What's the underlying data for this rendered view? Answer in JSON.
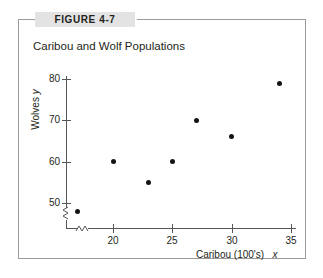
{
  "figure": {
    "label": "FIGURE 4-7",
    "frame_color": "#9a9a9a",
    "label_background": "#e3e3e3"
  },
  "chart_data": {
    "type": "scatter",
    "title": "Caribou and Wolf Populations",
    "xlabel": "Caribou (100's)  x",
    "xlabel_text": "Caribou (100's)",
    "xlabel_var": "x",
    "ylabel": "Wolves  y",
    "ylabel_text": "Wolves",
    "ylabel_var": "y",
    "xlim": [
      16,
      35.5
    ],
    "ylim": [
      46,
      82
    ],
    "xticks": [
      20,
      25,
      30,
      35
    ],
    "xtick_labels": [
      "20",
      "25",
      "30",
      "35"
    ],
    "yticks": [
      50,
      60,
      70,
      80
    ],
    "ytick_labels": [
      "50",
      "60",
      "70",
      "80"
    ],
    "grid": false,
    "legend": null,
    "axis_break_x": true,
    "axis_break_y": true,
    "marker_color": "#141414",
    "axis_color": "#555555",
    "points": [
      {
        "x": 17,
        "y": 48
      },
      {
        "x": 20,
        "y": 60
      },
      {
        "x": 23,
        "y": 55
      },
      {
        "x": 25,
        "y": 60
      },
      {
        "x": 27,
        "y": 70
      },
      {
        "x": 30,
        "y": 66
      },
      {
        "x": 34,
        "y": 79
      }
    ],
    "x": [
      17,
      20,
      23,
      25,
      27,
      30,
      34
    ],
    "y": [
      48,
      60,
      55,
      60,
      70,
      66,
      79
    ]
  }
}
